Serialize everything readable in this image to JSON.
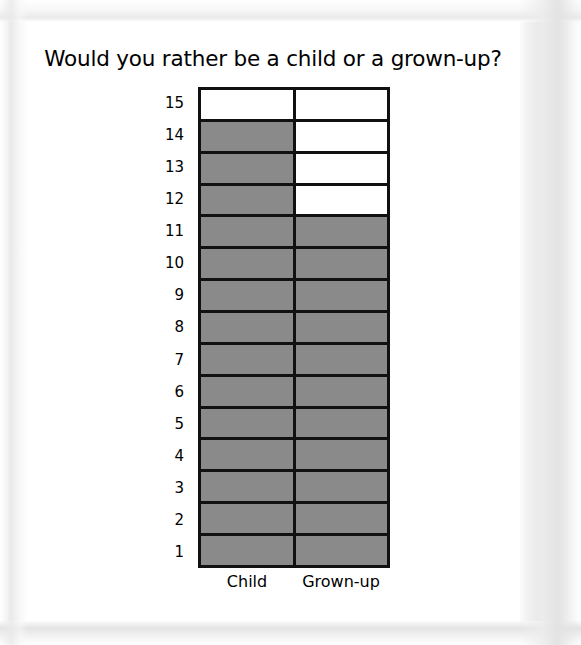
{
  "page": {
    "title": "Would you rather be a child or a grown-up?"
  },
  "colors": {
    "filled": "#8a8a8a",
    "empty": "#ffffff",
    "grid_line": "#111111",
    "text": "#000000",
    "page": "#ffffff"
  },
  "chart_data": {
    "type": "bar",
    "title": "Would you rather be a child or a grown-up?",
    "xlabel": "",
    "ylabel": "",
    "categories": [
      "Child",
      "Grown-up"
    ],
    "values": [
      14,
      11
    ],
    "series": [
      {
        "name": "Votes",
        "values": [
          14,
          11
        ]
      }
    ],
    "ylim": [
      0,
      15
    ],
    "yticks": [
      1,
      2,
      3,
      4,
      5,
      6,
      7,
      8,
      9,
      10,
      11,
      12,
      13,
      14,
      15
    ],
    "ytick_labels": [
      "1",
      "2",
      "3",
      "4",
      "5",
      "6",
      "7",
      "8",
      "9",
      "10",
      "11",
      "12",
      "13",
      "14",
      "15"
    ],
    "grid": true,
    "legend": false,
    "style": "stacked-square-pictograph"
  },
  "y_axis": {
    "ticks_top_to_bottom": [
      "15",
      "14",
      "13",
      "12",
      "11",
      "10",
      "9",
      "8",
      "7",
      "6",
      "5",
      "4",
      "3",
      "2",
      "1"
    ]
  },
  "x_axis": {
    "labels": [
      "Child",
      "Grown-up"
    ]
  }
}
